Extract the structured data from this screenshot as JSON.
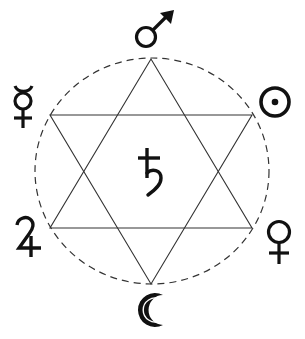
{
  "diagram": {
    "title": "Hexagram of the Seven Planets",
    "type": "hexagram-planetary-correspondence",
    "colors": {
      "background": "#ffffff",
      "ink": "#111111",
      "line": "#333333"
    },
    "circle": {
      "style": "dashed",
      "cx": 152,
      "cy": 171,
      "rx": 117,
      "ry": 113
    },
    "triangles": [
      {
        "name": "upward-triangle",
        "points": [
          [
            151,
            59
          ],
          [
            50,
            228
          ],
          [
            252,
            228
          ]
        ]
      },
      {
        "name": "downward-triangle",
        "points": [
          [
            50,
            115
          ],
          [
            252,
            115
          ],
          [
            151,
            284
          ]
        ]
      }
    ],
    "planets": [
      {
        "name": "Mars",
        "symbol": "♂",
        "position": "top",
        "x": 148,
        "y": 35
      },
      {
        "name": "Sun",
        "symbol": "☉",
        "position": "upper-right",
        "x": 275,
        "y": 102
      },
      {
        "name": "Venus",
        "symbol": "♀",
        "position": "lower-right",
        "x": 279,
        "y": 240
      },
      {
        "name": "Moon",
        "symbol": "☾",
        "position": "bottom",
        "x": 152,
        "y": 310
      },
      {
        "name": "Jupiter",
        "symbol": "♃",
        "position": "lower-left",
        "x": 28,
        "y": 238
      },
      {
        "name": "Mercury",
        "symbol": "☿",
        "position": "upper-left",
        "x": 23,
        "y": 105
      },
      {
        "name": "Saturn",
        "symbol": "♄",
        "position": "center",
        "x": 149,
        "y": 172
      }
    ]
  }
}
